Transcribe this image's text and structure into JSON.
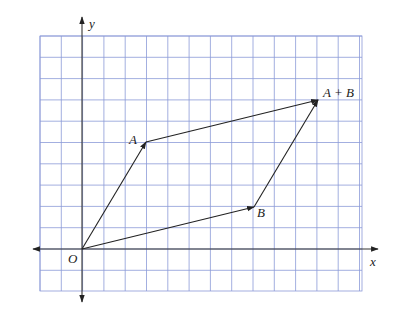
{
  "figure": {
    "type": "vector-addition-parallelogram",
    "grid": {
      "x_min": -2,
      "x_max": 13,
      "y_min": -2,
      "y_max": 10,
      "color": "#7f8fd6"
    },
    "axes": {
      "x_label": "x",
      "y_label": "y",
      "origin_label": "O",
      "color": "#333333"
    },
    "vectors": [
      {
        "name": "OA",
        "from": [
          0,
          0
        ],
        "to": [
          3,
          5
        ]
      },
      {
        "name": "OB",
        "from": [
          0,
          0
        ],
        "to": [
          8,
          2
        ]
      },
      {
        "name": "A_to_AplusB",
        "from": [
          3,
          5
        ],
        "to": [
          11,
          7
        ]
      },
      {
        "name": "B_to_AplusB",
        "from": [
          8,
          2
        ],
        "to": [
          11,
          7
        ]
      }
    ],
    "points": [
      {
        "label": "A",
        "coords": [
          3,
          5
        ]
      },
      {
        "label": "B",
        "coords": [
          8,
          2
        ]
      },
      {
        "label": "A + B",
        "coords": [
          11,
          7
        ]
      }
    ]
  },
  "labels": {
    "x": "x",
    "y": "y",
    "O": "O",
    "A": "A",
    "B": "B",
    "AB": "A + B"
  }
}
